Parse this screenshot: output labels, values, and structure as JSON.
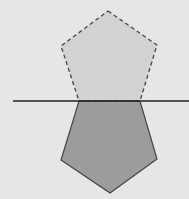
{
  "diagram": {
    "colors": {
      "background": "#e6e6e6",
      "original_fill": "#d2d2d2",
      "reflected_fill": "#9c9c9c",
      "stroke": "#444444",
      "mirror_line": "#222222"
    },
    "original_pentagon": {
      "style": "dashed",
      "points": [
        [
          108,
          11
        ],
        [
          157,
          45
        ],
        [
          140,
          101
        ],
        [
          79,
          101
        ],
        [
          61,
          46
        ]
      ]
    },
    "reflected_pentagon": {
      "style": "solid",
      "points": [
        [
          79,
          101
        ],
        [
          140,
          101
        ],
        [
          157,
          159
        ],
        [
          110,
          193
        ],
        [
          61,
          160
        ]
      ]
    },
    "mirror_line": {
      "x1": 13,
      "y1": 101,
      "x2": 189,
      "y2": 101
    }
  }
}
